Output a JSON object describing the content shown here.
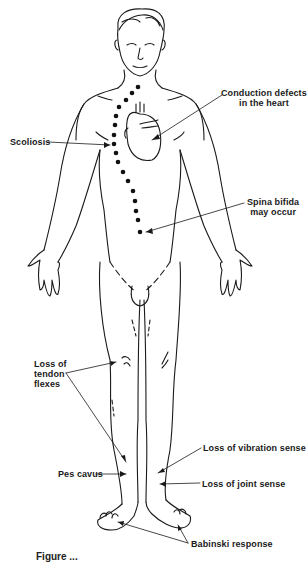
{
  "diagram": {
    "style": "black line drawing on white",
    "colors": {
      "line": "#1a1a1a",
      "background": "#ffffff",
      "dots": "#111111"
    },
    "labels": {
      "conduction": {
        "line1": "Conduction defects",
        "line2": "in the heart"
      },
      "scoliosis": {
        "text": "Scoliosis"
      },
      "spina_bifida": {
        "line1": "Spina bifida",
        "line2": "may occur"
      },
      "tendon": {
        "line1": "Loss of",
        "line2": "tendon",
        "line3": "flexes"
      },
      "vibration": {
        "text": "Loss of vibration sense"
      },
      "pes_cavus": {
        "text": "Pes cavus"
      },
      "joint": {
        "text": "Loss of joint sense"
      },
      "babinski": {
        "text": "Babinski response"
      }
    },
    "caption": {
      "text": "Figure ...",
      "visibility": "cut off at bottom edge"
    },
    "spine_dots_count": 17
  }
}
